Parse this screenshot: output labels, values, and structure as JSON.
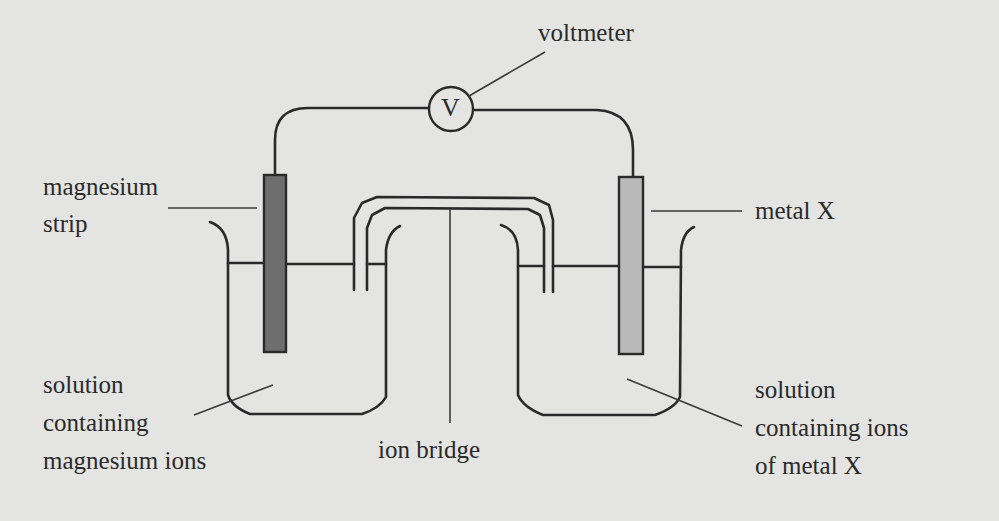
{
  "diagram": {
    "colors": {
      "background": "#e4e4e2",
      "line": "#2a2a2a",
      "magnesium_strip": "#6e6e6e",
      "metal_x_strip": "#b9b9b9"
    },
    "labels": {
      "voltmeter": "voltmeter",
      "voltmeter_symbol": "V",
      "magnesium_strip": [
        "magnesium",
        "strip"
      ],
      "metal_x": "metal X",
      "solution_left": [
        "solution",
        "containing",
        "magnesium ions"
      ],
      "ion_bridge": "ion bridge",
      "solution_right": [
        "solution",
        "containing ions",
        "of metal X"
      ]
    }
  }
}
